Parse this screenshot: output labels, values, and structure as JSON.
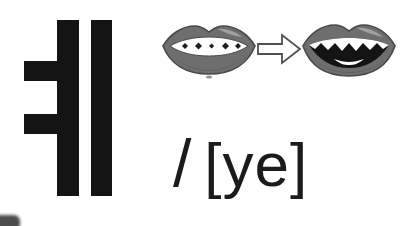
{
  "card": {
    "background_color": "#ffffff",
    "width": 403,
    "height": 226
  },
  "letter": {
    "name": "hangul-vowel-ye",
    "glyph": "ㅎ",
    "display_character": "ㅖ",
    "romanization": "ye",
    "stroke_color": "#141414",
    "strokes": [
      {
        "name": "vertical-primary",
        "type": "vertical"
      },
      {
        "name": "vertical-secondary",
        "type": "vertical"
      },
      {
        "name": "horizontal-upper",
        "type": "horizontal"
      },
      {
        "name": "horizontal-lower",
        "type": "horizontal"
      }
    ]
  },
  "articulation": {
    "label_before": "mouth closed position",
    "label_after": "mouth open position",
    "arrow": "right-arrow",
    "lip_color": "#6e6e6e",
    "lip_shadow_color": "#555555",
    "lip_highlight_color": "#a9a9a9",
    "teeth_color": "#ffffff",
    "mouth_interior_color": "#141414",
    "outline_color": "#4a4a4a"
  },
  "phonetic": {
    "slash": "/",
    "transcription": "[ye]",
    "text_color": "#1b1b1b"
  },
  "artifact": {
    "name": "cropped-corner-mark",
    "color": "#3e3e3e"
  }
}
